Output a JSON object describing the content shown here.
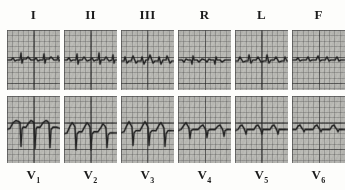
{
  "document": {
    "type": "12-lead electrocardiogram (ECG) strip montage",
    "background_color": "#fdfdfb",
    "grid_color": "#b9b9b4",
    "trace_color": "#232323",
    "panel_count": 12
  },
  "rows": [
    {
      "name": "limb-leads-row",
      "label_position": "top",
      "leads": [
        {
          "label": "I",
          "sub": "",
          "name": "lead-i"
        },
        {
          "label": "II",
          "sub": "",
          "name": "lead-ii"
        },
        {
          "label": "III",
          "sub": "",
          "name": "lead-iii"
        },
        {
          "label": "R",
          "sub": "",
          "name": "lead-avr"
        },
        {
          "label": "L",
          "sub": "",
          "name": "lead-avl"
        },
        {
          "label": "F",
          "sub": "",
          "name": "lead-avf"
        }
      ]
    },
    {
      "name": "precordial-leads-row",
      "label_position": "bottom",
      "leads": [
        {
          "label": "V",
          "sub": "1",
          "name": "lead-v1"
        },
        {
          "label": "V",
          "sub": "2",
          "name": "lead-v2"
        },
        {
          "label": "V",
          "sub": "3",
          "name": "lead-v3"
        },
        {
          "label": "V",
          "sub": "4",
          "name": "lead-v4"
        },
        {
          "label": "V",
          "sub": "5",
          "name": "lead-v5"
        },
        {
          "label": "V",
          "sub": "6",
          "name": "lead-v6"
        }
      ]
    }
  ],
  "chart_data": {
    "type": "line",
    "title": "",
    "xlabel": "",
    "ylabel": "",
    "grid": true,
    "legend": "none",
    "series": [
      {
        "name": "I",
        "baseline_y": 30,
        "path": "M0,30 L4,30 L6,28 L8,31 L10,30 L13,30 L14,23 L15,33 L16,29 L19,29 L21,27 L24,30 L27,30 L29,28 L31,31 L33,30 L36,30 L37,24 L38,33 L39,29 L42,29 L44,27 L47,30 L50,30 L51,26 L52,31 L53,30"
      },
      {
        "name": "II",
        "baseline_y": 30,
        "path": "M0,30 L3,30 L5,28 L7,31 L9,30 L12,30 L13,24 L14,34 L15,30 L18,30 L20,27 L23,31 L26,30 L28,28 L30,31 L32,30 L34,30 L35,23 L36,34 L37,30 L40,30 L42,27 L45,31 L48,30 L49,25 L50,33 L51,30 L53,30"
      },
      {
        "name": "III",
        "baseline_y": 30,
        "path": "M0,31 L3,31 L4,27 L6,33 L8,31 L10,31 L12,26 L15,33 L17,31 L20,31 L21,27 L23,34 L25,30 L27,30 L29,25 L32,33 L34,31 L37,31 L38,27 L40,34 L42,30 L45,30 L46,26 L49,33 L51,31 L53,31"
      },
      {
        "name": "R",
        "baseline_y": 30,
        "path": "M0,30 L4,30 L6,32 L8,29 L10,30 L13,30 L14,34 L15,26 L16,30 L19,30 L21,32 L24,29 L27,30 L29,32 L31,29 L33,30 L36,30 L37,34 L38,27 L39,30 L42,30 L44,32 L47,30 L50,30 L52,30 L53,30"
      },
      {
        "name": "L",
        "baseline_y": 31,
        "path": "M0,31 L3,31 L5,27 L8,32 L11,31 L13,31 L14,25 L16,33 L18,30 L21,30 L23,27 L26,32 L29,31 L31,31 L32,25 L34,33 L36,30 L39,30 L41,27 L44,32 L47,31 L49,31 L50,27 L52,31 L53,31"
      },
      {
        "name": "F",
        "baseline_y": 30,
        "path": "M0,30 L4,30 L6,28 L8,31 L10,30 L14,30 L16,27 L18,31 L20,30 L24,30 L26,26 L28,31 L30,30 L33,30 L35,27 L37,31 L39,30 L43,30 L45,27 L47,31 L49,30 L53,30"
      },
      {
        "name": "V1",
        "baseline_y": 28,
        "path": "M0,30 L3,29 L6,24 L9,22 L12,23 L13,24 L14,45 L15,30 L16,28 L19,28 L21,25 L24,22 L26,23 L27,24 L28,47 L29,30 L30,28 L33,28 L36,24 L39,22 L41,23 L42,25 L43,46 L44,30 L46,28 L50,28 L53,29"
      },
      {
        "name": "V2",
        "baseline_y": 32,
        "path": "M0,34 L3,33 L6,27 L8,24 L10,26 L11,28 L12,48 L13,34 L15,32 L18,32 L21,27 L23,24 L25,26 L26,28 L27,48 L28,34 L30,32 L34,32 L37,28 L39,25 L41,27 L42,29 L43,46 L44,35 L46,33 L50,33 L53,33"
      },
      {
        "name": "V3",
        "baseline_y": 31,
        "path": "M0,33 L3,32 L6,26 L8,23 L10,26 L11,28 L12,44 L13,33 L15,31 L19,31 L22,26 L24,23 L26,26 L27,28 L28,44 L29,33 L31,31 L35,31 L38,26 L40,24 L42,27 L43,29 L44,45 L45,34 L47,31 L51,31 L53,31"
      },
      {
        "name": "V4",
        "baseline_y": 30,
        "path": "M0,31 L3,30 L6,26 L8,24 L10,27 L11,29 L12,38 L13,31 L15,30 L20,30 L23,27 L25,26 L27,29 L28,31 L29,37 L30,31 L32,30 L37,30 L40,27 L42,26 L44,29 L45,31 L46,36 L47,31 L49,30 L53,30"
      },
      {
        "name": "V5",
        "baseline_y": 30,
        "path": "M0,31 L3,30 L5,27 L7,26 L9,29 L10,31 L11,34 L12,30 L14,30 L19,30 L21,27 L23,26 L25,29 L26,31 L27,34 L28,30 L30,30 L35,30 L37,27 L39,26 L41,29 L42,31 L43,34 L44,30 L46,30 L53,30"
      },
      {
        "name": "V6",
        "baseline_y": 30,
        "path": "M0,30 L4,30 L6,27 L8,26 L10,29 L11,30 L12,32 L13,30 L16,30 L21,30 L23,27 L25,26 L27,29 L28,30 L29,32 L30,30 L33,30 L38,30 L40,27 L42,26 L44,29 L45,30 L46,32 L47,30 L50,30 L53,30"
      }
    ]
  }
}
